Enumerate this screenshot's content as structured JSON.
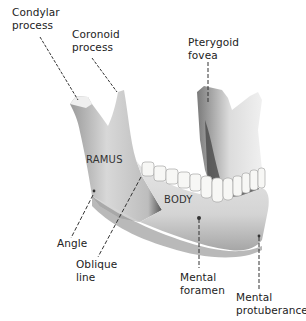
{
  "diagram": {
    "colors": {
      "bone_light": "#f1f1f1",
      "bone_mid": "#c9c9c9",
      "bone_dark": "#5a5a5a",
      "tooth": "#f7f7f5",
      "leader": "#333333",
      "text": "#222222"
    },
    "labels": {
      "condylar_process": "Condylar\nprocess",
      "coronoid_process": "Coronoid\nprocess",
      "pterygoid_fovea": "Pterygoid\nfovea",
      "angle": "Angle",
      "oblique_line": "Oblique\nline",
      "mental_foramen": "Mental\nforamen",
      "mental_protuberance": "Mental\nprotuberance"
    },
    "regions": {
      "ramus": "RAMUS",
      "body": "BODY"
    }
  }
}
